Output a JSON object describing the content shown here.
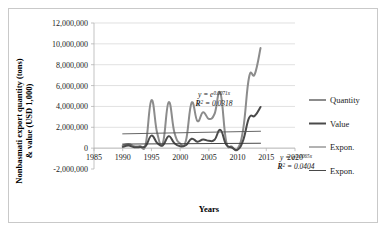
{
  "figure": {
    "yaxis_title_line1": "Nonbasmati export quantity (tons)",
    "yaxis_title_line2": "& value (USD 1,000)",
    "xaxis_title": "Years"
  },
  "annotations": [
    {
      "id": "quantity-trend-equation",
      "eq_prefix": "y = e",
      "eq_exponent": "0.0071x",
      "r2_prefix": "R",
      "r2_sup": "2",
      "r2_value": " = 0.0318"
    },
    {
      "id": "value-trend-equation",
      "eq_prefix": "y = e",
      "eq_exponent": "0.0065x",
      "r2_prefix": "R",
      "r2_sup": "2",
      "r2_value": " = 0.0404"
    }
  ],
  "legend": {
    "position": "right",
    "items": [
      {
        "label": "Quantity",
        "color": "#8c8c8c",
        "width": 2.0
      },
      {
        "label": "Value",
        "color": "#4a4a4a",
        "width": 2.0
      },
      {
        "label": "Expon.",
        "color": "#555555",
        "width": 0.9
      },
      {
        "label": "Expon.",
        "color": "#333333",
        "width": 0.9
      }
    ]
  },
  "chart_data": {
    "type": "line",
    "title": "",
    "xlabel": "Years",
    "ylabel": "Nonbasmati export quantity (tons) & value (USD 1,000)",
    "xlim": [
      1985,
      2020
    ],
    "ylim": [
      -2000000,
      12000000
    ],
    "xticks": [
      1985,
      1990,
      1995,
      2000,
      2005,
      2010,
      2015,
      2020
    ],
    "xtick_labels": [
      "1985",
      "1990",
      "1995",
      "2000",
      "2005",
      "2010",
      "2015",
      "2020"
    ],
    "yticks": [
      -2000000,
      0,
      2000000,
      4000000,
      6000000,
      8000000,
      10000000,
      12000000
    ],
    "ytick_labels": [
      "-2,000,000",
      "0",
      "2,000,000",
      "4,000,000",
      "6,000,000",
      "8,000,000",
      "10,000,000",
      "12,000,000"
    ],
    "grid": true,
    "grid_axis": "y",
    "legend_position": "right",
    "series": [
      {
        "name": "Quantity",
        "color": "#8c8c8c",
        "width": 2.0,
        "x": [
          1990,
          1991,
          1992,
          1993,
          1994,
          1995,
          1996,
          1997,
          1998,
          1999,
          2000,
          2001,
          2002,
          2003,
          2004,
          2005,
          2006,
          2007,
          2008,
          2009,
          2010,
          2011,
          2012,
          2013,
          2014
        ],
        "y": [
          250000,
          400000,
          180000,
          200000,
          380000,
          4600000,
          1450000,
          500000,
          4400000,
          1500000,
          450000,
          700000,
          4350000,
          2600000,
          3450000,
          2800000,
          3300000,
          5300000,
          700000,
          150000,
          -50000,
          1900000,
          6800000,
          7100000,
          9600000
        ]
      },
      {
        "name": "Value",
        "color": "#4a4a4a",
        "width": 2.0,
        "x": [
          1990,
          1991,
          1992,
          1993,
          1994,
          1995,
          1996,
          1997,
          1998,
          1999,
          2000,
          2001,
          2002,
          2003,
          2004,
          2005,
          2006,
          2007,
          2008,
          2009,
          2010,
          2011,
          2012,
          2013,
          2014
        ],
        "y": [
          120000,
          250000,
          90000,
          110000,
          200000,
          1200000,
          500000,
          260000,
          1150000,
          480000,
          180000,
          280000,
          900000,
          620000,
          820000,
          700000,
          800000,
          1750000,
          350000,
          60000,
          -150000,
          800000,
          2900000,
          3100000,
          3950000
        ]
      },
      {
        "name": "Expon.",
        "type": "trendline",
        "color": "#555555",
        "width": 0.9,
        "x": [
          1990,
          2014
        ],
        "y": [
          1370000,
          1620000
        ]
      },
      {
        "name": "Expon.",
        "type": "trendline",
        "color": "#333333",
        "width": 0.9,
        "x": [
          1990,
          2014
        ],
        "y": [
          390000,
          470000
        ]
      }
    ]
  }
}
